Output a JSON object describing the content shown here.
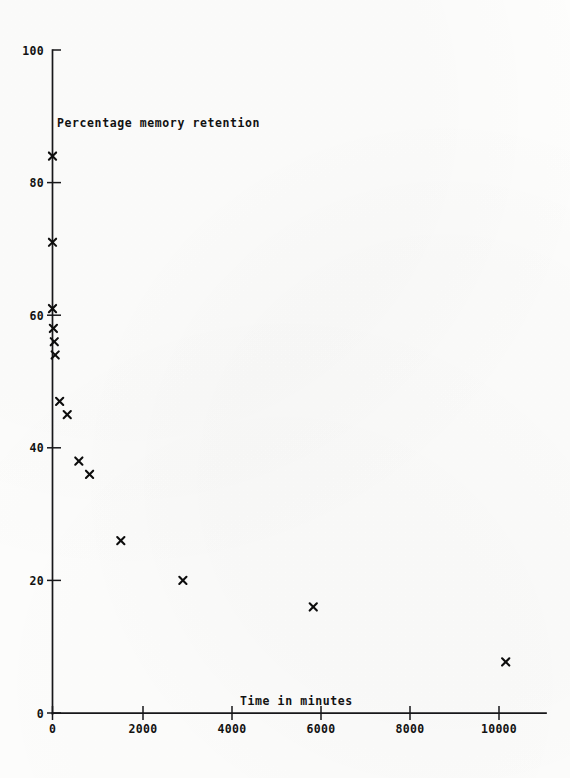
{
  "figure": {
    "background_color": "#fdfdfc",
    "ink_color": "#17171a"
  },
  "chart_data": {
    "type": "scatter",
    "title": "",
    "xlabel": "Time in minutes",
    "ylabel": "Percentage memory retention",
    "xlim": [
      0,
      11400
    ],
    "ylim": [
      0,
      100
    ],
    "grid": false,
    "legend": null,
    "marker": "x",
    "marker_color": "#0d0d0d",
    "xticks": [
      0,
      2000,
      4000,
      6000,
      8000,
      10000
    ],
    "xticklabels": [
      "0",
      "2000",
      "4000",
      "6000",
      "8000",
      "10000"
    ],
    "yticks": [
      0,
      20,
      40,
      60,
      80,
      100
    ],
    "yticklabels": [
      "0",
      "20",
      "40",
      "60",
      "80",
      "100"
    ],
    "x": [
      0,
      0,
      0,
      40,
      60,
      160,
      330,
      590,
      830,
      1530,
      2920,
      5840,
      10150,
      20
    ],
    "y": [
      84,
      71,
      61,
      56,
      54,
      47,
      45,
      38,
      36,
      26,
      20,
      16,
      7.7,
      58
    ],
    "points": [
      {
        "x": 0,
        "y": 84
      },
      {
        "x": 0,
        "y": 71
      },
      {
        "x": 0,
        "y": 61
      },
      {
        "x": 20,
        "y": 58
      },
      {
        "x": 40,
        "y": 56
      },
      {
        "x": 60,
        "y": 54
      },
      {
        "x": 160,
        "y": 47
      },
      {
        "x": 330,
        "y": 45
      },
      {
        "x": 590,
        "y": 38
      },
      {
        "x": 830,
        "y": 36
      },
      {
        "x": 1530,
        "y": 26
      },
      {
        "x": 2920,
        "y": 20
      },
      {
        "x": 5840,
        "y": 16
      },
      {
        "x": 10150,
        "y": 7.7
      }
    ]
  },
  "labels": {
    "y_axis_title": "Percentage memory retention",
    "x_axis_title": "Time in minutes",
    "y_tick_100": "100",
    "y_tick_80": "80",
    "y_tick_60": "60",
    "y_tick_40": "40",
    "y_tick_20": "20",
    "y_tick_0": "0",
    "x_tick_0": "0",
    "x_tick_2000": "2000",
    "x_tick_4000": "4000",
    "x_tick_6000": "6000",
    "x_tick_8000": "8000",
    "x_tick_10000": "10000"
  }
}
